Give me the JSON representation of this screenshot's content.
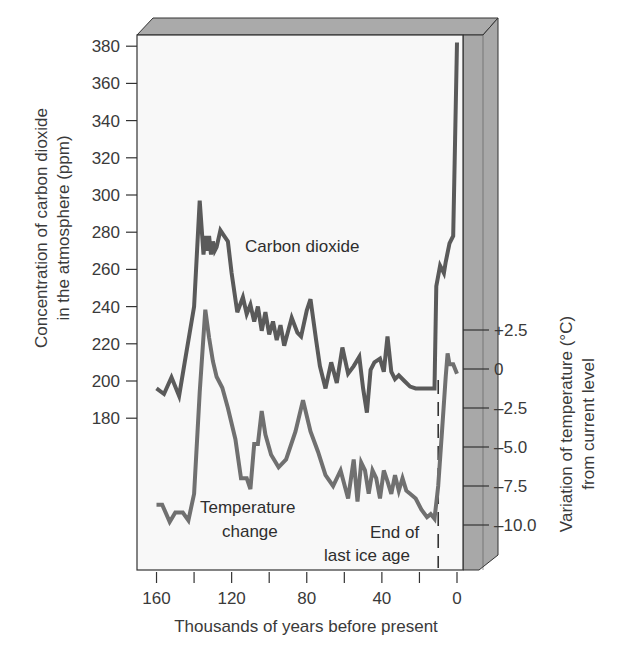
{
  "chart_data": {
    "type": "line",
    "title": "",
    "xlabel": "Thousands of years before present",
    "ylabel_left": [
      "Concentration of carbon dioxide",
      "in the atmosphere (ppm)"
    ],
    "ylabel_right": [
      "Variation of temperature (°C)",
      "from current level"
    ],
    "x_ticks": [
      160,
      140,
      120,
      100,
      80,
      60,
      40,
      20,
      0
    ],
    "x_tick_labels": [
      "160",
      "",
      "120",
      "",
      "80",
      "",
      "40",
      "",
      "0"
    ],
    "xlim": [
      160,
      0
    ],
    "y_left_ticks": [
      180,
      200,
      220,
      240,
      260,
      280,
      300,
      320,
      340,
      360,
      380
    ],
    "y_left_tick_labels": [
      "180",
      "200",
      "220",
      "240",
      "260",
      "280",
      "300",
      "320",
      "340",
      "360",
      "380"
    ],
    "y_left_range": [
      180,
      380
    ],
    "y_right_ticks": [
      2.5,
      0,
      -2.5,
      -5.0,
      -7.5,
      -10.0
    ],
    "y_right_tick_labels": [
      "+2.5",
      "0",
      "–2.5",
      "–5.0",
      "–7.5",
      "–10.0"
    ],
    "grid": false,
    "legend": "none (inline labels)",
    "series": [
      {
        "name": "Carbon dioxide",
        "axis": "left",
        "unit": "ppm",
        "color": "#5a5a5a",
        "x": [
          160,
          156,
          152,
          148,
          145,
          140,
          137,
          135,
          134,
          133,
          132,
          131,
          130,
          129,
          128,
          126,
          124,
          122,
          120,
          117,
          114,
          112,
          110,
          108,
          106,
          104,
          102,
          100,
          98,
          96,
          94,
          92,
          88,
          85,
          83,
          80,
          78,
          75,
          73,
          70,
          67,
          64,
          61,
          58,
          55,
          52,
          50,
          48,
          46,
          44,
          41,
          39,
          37,
          35,
          33,
          31,
          28,
          25,
          22,
          20,
          18,
          16,
          14,
          12,
          11,
          11,
          9,
          7,
          6,
          4,
          2,
          1,
          0
        ],
        "values": [
          196,
          193,
          202,
          192,
          210,
          240,
          297,
          268,
          278,
          270,
          278,
          268,
          275,
          270,
          272,
          281,
          278,
          275,
          258,
          237,
          245,
          236,
          241,
          232,
          240,
          227,
          237,
          225,
          232,
          222,
          230,
          219,
          234,
          226,
          224,
          238,
          244,
          222,
          208,
          196,
          210,
          199,
          218,
          204,
          208,
          213,
          196,
          183,
          206,
          210,
          212,
          205,
          224,
          205,
          201,
          203,
          200,
          197,
          196,
          196,
          196,
          196,
          196,
          196,
          251,
          251,
          262,
          258,
          264,
          274,
          278,
          330,
          382
        ]
      },
      {
        "name": "Temperature change",
        "axis": "right",
        "unit": "°C",
        "color": "#6e6e6e",
        "x": [
          160,
          157,
          153,
          150,
          146,
          143,
          140,
          137,
          134,
          132,
          130,
          128,
          125,
          122,
          118,
          115,
          112,
          110,
          108,
          106,
          104,
          102,
          99,
          95,
          91,
          86,
          82,
          78,
          74,
          70,
          66,
          62,
          58,
          55,
          53,
          51,
          49,
          47,
          45,
          43,
          41,
          39,
          37,
          35,
          33,
          31,
          29,
          27,
          25,
          22,
          19,
          16,
          14,
          12,
          10,
          8,
          6,
          5,
          4,
          2,
          0
        ],
        "values": [
          -8.7,
          -8.7,
          -9.8,
          -9.2,
          -9.2,
          -9.7,
          -8.0,
          -1.5,
          3.8,
          2.0,
          0.5,
          -0.5,
          -1.2,
          -2.5,
          -4.5,
          -7.0,
          -7.0,
          -7.7,
          -4.8,
          -4.8,
          -2.7,
          -4.2,
          -5.5,
          -6.3,
          -5.8,
          -4.0,
          -2.0,
          -4.0,
          -5.3,
          -6.8,
          -7.5,
          -6.5,
          -8.3,
          -5.8,
          -8.5,
          -6.0,
          -6.5,
          -8.0,
          -6.5,
          -7.0,
          -8.3,
          -6.5,
          -7.2,
          -8.0,
          -6.8,
          -7.8,
          -7.0,
          -7.8,
          -8.0,
          -8.3,
          -9.0,
          -9.5,
          -9.3,
          -9.6,
          -7.5,
          -4.0,
          -0.5,
          1.0,
          0.3,
          0.3,
          -0.3
        ]
      }
    ],
    "annotations": [
      {
        "id": "co2-label",
        "text": "Carbon dioxide"
      },
      {
        "id": "temp-label-1",
        "text": "Temperature"
      },
      {
        "id": "temp-label-2",
        "text": "change"
      },
      {
        "id": "ice-age-label-1",
        "text": "End of"
      },
      {
        "id": "ice-age-label-2",
        "text": "last ice age"
      }
    ],
    "markers": [
      {
        "type": "dashed-vertical-line",
        "x": 10,
        "label": "End of last ice age"
      }
    ]
  },
  "labels": {
    "x_axis_title": "Thousands of years before present",
    "y_left_title_1": "Concentration of carbon dioxide",
    "y_left_title_2": "in the atmosphere (ppm)",
    "y_right_title_1": "Variation of temperature (°C)",
    "y_right_title_2": "from current level",
    "co2_label": "Carbon dioxide",
    "temp_label_1": "Temperature",
    "temp_label_2": "change",
    "ice_label_1": "End of",
    "ice_label_2": "last ice age"
  },
  "colors": {
    "face": "#f7f7f7",
    "bevel": "#aaaaaa",
    "side": "#a9a9a9",
    "frame": "#333333",
    "co2_line": "#5a5a5a",
    "temp_line": "#707070"
  }
}
